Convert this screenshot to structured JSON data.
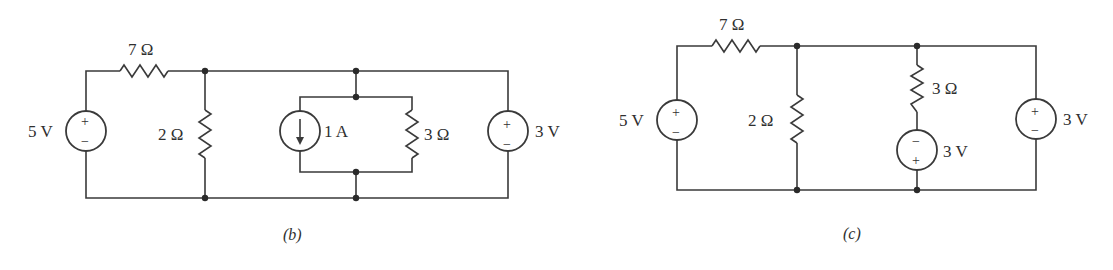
{
  "circuit_b": {
    "caption": "(b)",
    "source_left": {
      "label": "5 V",
      "plus": "+",
      "minus": "−"
    },
    "resistor_series": {
      "label": "7 Ω"
    },
    "resistor_shunt": {
      "label": "2 Ω"
    },
    "current_source": {
      "label": "1 A",
      "direction": "down"
    },
    "resistor_parallel": {
      "label": "3 Ω"
    },
    "source_right": {
      "label": "3 V",
      "plus": "+",
      "minus": "−"
    }
  },
  "circuit_c": {
    "caption": "(c)",
    "source_left": {
      "label": "5 V",
      "plus": "+",
      "minus": "−"
    },
    "resistor_series": {
      "label": "7 Ω"
    },
    "resistor_shunt": {
      "label": "2 Ω"
    },
    "resistor_branch": {
      "label": "3 Ω"
    },
    "source_branch": {
      "label": "3 V",
      "plus": "+",
      "minus": "−"
    },
    "source_right": {
      "label": "3 V",
      "plus": "+",
      "minus": "−"
    }
  }
}
